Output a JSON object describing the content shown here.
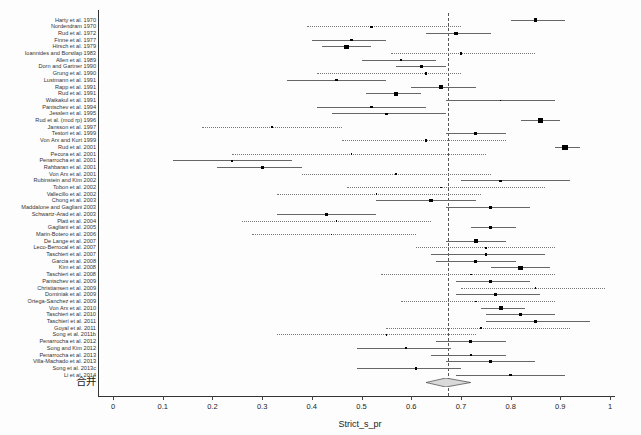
{
  "chart_data": {
    "type": "forest",
    "title": "",
    "xlabel": "Strict_s_pr",
    "xlim": [
      0,
      1
    ],
    "xtick_labels": [
      "0",
      "0.1",
      "0.2",
      "0.3",
      "0.4",
      "0.5",
      "0.6",
      "0.7",
      "0.8",
      "0.9",
      "1"
    ],
    "xtick_values": [
      0,
      0.1,
      0.2,
      0.3,
      0.4,
      0.5,
      0.6,
      0.7,
      0.8,
      0.9,
      1
    ],
    "reference_line": 0.675,
    "grid": false,
    "colors": {
      "axis": "#333333",
      "ci_line": "#666666",
      "marker": "#000000",
      "reference": "#555555",
      "diamond_fill": "#d9d9d9"
    },
    "studies": [
      {
        "label": "Harty et al. 1970",
        "est": 0.85,
        "lo": 0.8,
        "hi": 0.91,
        "size": 3
      },
      {
        "label": "Nordendram 1970",
        "est": 0.52,
        "lo": 0.39,
        "hi": 0.7,
        "size": 2
      },
      {
        "label": "Rud et al. 1972",
        "est": 0.69,
        "lo": 0.63,
        "hi": 0.76,
        "size": 3
      },
      {
        "label": "Finne et al. 1977",
        "est": 0.48,
        "lo": 0.4,
        "hi": 0.55,
        "size": 2
      },
      {
        "label": "Hirsch et al. 1979",
        "est": 0.47,
        "lo": 0.42,
        "hi": 0.52,
        "size": 4
      },
      {
        "label": "Ioannides and Borstlap 1983",
        "est": 0.7,
        "lo": 0.56,
        "hi": 0.85,
        "size": 2
      },
      {
        "label": "Allen et al. 1989",
        "est": 0.58,
        "lo": 0.5,
        "hi": 0.65,
        "size": 2
      },
      {
        "label": "Dorn and Gartner 1990",
        "est": 0.62,
        "lo": 0.57,
        "hi": 0.67,
        "size": 3
      },
      {
        "label": "Grung et al. 1990",
        "est": 0.63,
        "lo": 0.41,
        "hi": 0.7,
        "size": 2
      },
      {
        "label": "Lustmann et al. 1991",
        "est": 0.45,
        "lo": 0.35,
        "hi": 0.55,
        "size": 2
      },
      {
        "label": "Rapp et al. 1991",
        "est": 0.66,
        "lo": 0.6,
        "hi": 0.73,
        "size": 3
      },
      {
        "label": "Rud et al. 1991",
        "est": 0.57,
        "lo": 0.51,
        "hi": 0.62,
        "size": 4
      },
      {
        "label": "Waikakul et al. 1991",
        "est": 0.78,
        "lo": 0.67,
        "hi": 0.89,
        "size": 1
      },
      {
        "label": "Pantschev et al. 1994",
        "est": 0.52,
        "lo": 0.41,
        "hi": 0.63,
        "size": 2
      },
      {
        "label": "Jesslen et al. 1995",
        "est": 0.55,
        "lo": 0.44,
        "hi": 0.67,
        "size": 2
      },
      {
        "label": "Rud et al. (mod rp) 1996",
        "est": 0.86,
        "lo": 0.82,
        "hi": 0.9,
        "size": 4
      },
      {
        "label": "Jansson et al. 1997",
        "est": 0.32,
        "lo": 0.18,
        "hi": 0.46,
        "size": 2
      },
      {
        "label": "Testori et al. 1999",
        "est": 0.73,
        "lo": 0.67,
        "hi": 0.79,
        "size": 3
      },
      {
        "label": "Von Arx and Kurt 1999",
        "est": 0.63,
        "lo": 0.46,
        "hi": 0.79,
        "size": 2
      },
      {
        "label": "Rud et al. 2001",
        "est": 0.91,
        "lo": 0.89,
        "hi": 0.94,
        "size": 5
      },
      {
        "label": "Pecora et al. 2001",
        "est": 0.48,
        "lo": 0.24,
        "hi": 0.75,
        "size": 1
      },
      {
        "label": "Penarrocha et al. 2001",
        "est": 0.24,
        "lo": 0.12,
        "hi": 0.36,
        "size": 2
      },
      {
        "label": "Rahbaran et al. 2001",
        "est": 0.3,
        "lo": 0.21,
        "hi": 0.38,
        "size": 3
      },
      {
        "label": "Von Arx et al. 2001",
        "est": 0.57,
        "lo": 0.38,
        "hi": 0.76,
        "size": 2
      },
      {
        "label": "Rubinstein and Kim 2002",
        "est": 0.78,
        "lo": 0.7,
        "hi": 0.92,
        "size": 2
      },
      {
        "label": "Tobon et al. 2002",
        "est": 0.66,
        "lo": 0.47,
        "hi": 0.87,
        "size": 1
      },
      {
        "label": "Vallecillo et al. 2002",
        "est": 0.53,
        "lo": 0.33,
        "hi": 0.74,
        "size": 1
      },
      {
        "label": "Chong et al. 2003",
        "est": 0.64,
        "lo": 0.53,
        "hi": 0.73,
        "size": 3
      },
      {
        "label": "Maddalone and Gagliani 2003",
        "est": 0.76,
        "lo": 0.67,
        "hi": 0.84,
        "size": 3
      },
      {
        "label": "Schwartz-Arad et al. 2003",
        "est": 0.43,
        "lo": 0.33,
        "hi": 0.53,
        "size": 3
      },
      {
        "label": "Platt et al. 2004",
        "est": 0.45,
        "lo": 0.26,
        "hi": 0.64,
        "size": 1
      },
      {
        "label": "Gagliani et al. 2005",
        "est": 0.76,
        "lo": 0.72,
        "hi": 0.81,
        "size": 3
      },
      {
        "label": "Marin-Botero et al. 2006",
        "est": 0.44,
        "lo": 0.28,
        "hi": 0.61,
        "size": 1
      },
      {
        "label": "De Lange et al. 2007",
        "est": 0.73,
        "lo": 0.67,
        "hi": 0.79,
        "size": 4
      },
      {
        "label": "Leco-Berrocal et al. 2007",
        "est": 0.75,
        "lo": 0.61,
        "hi": 0.89,
        "size": 1
      },
      {
        "label": "Taschieri et al. 2007",
        "est": 0.75,
        "lo": 0.64,
        "hi": 0.87,
        "size": 2
      },
      {
        "label": "Garcia et al. 2008",
        "est": 0.73,
        "lo": 0.65,
        "hi": 0.81,
        "size": 3
      },
      {
        "label": "Kim et al. 2008",
        "est": 0.82,
        "lo": 0.76,
        "hi": 0.88,
        "size": 4
      },
      {
        "label": "Taschieri et al. 2008",
        "est": 0.72,
        "lo": 0.54,
        "hi": 0.89,
        "size": 1
      },
      {
        "label": "Pantschev et al. 2009",
        "est": 0.76,
        "lo": 0.69,
        "hi": 0.84,
        "size": 3
      },
      {
        "label": "Christiansen et al. 2009",
        "est": 0.85,
        "lo": 0.7,
        "hi": 0.99,
        "size": 1
      },
      {
        "label": "Dominiak et al. 2009",
        "est": 0.77,
        "lo": 0.69,
        "hi": 0.86,
        "size": 3
      },
      {
        "label": "Ortega-Sanchez et al. 2009",
        "est": 0.73,
        "lo": 0.58,
        "hi": 0.89,
        "size": 1
      },
      {
        "label": "Von Arx et al. 2010",
        "est": 0.78,
        "lo": 0.74,
        "hi": 0.83,
        "size": 4
      },
      {
        "label": "Taschieri et al. 2010",
        "est": 0.82,
        "lo": 0.75,
        "hi": 0.89,
        "size": 3
      },
      {
        "label": "Taschieri et al. 2011",
        "est": 0.85,
        "lo": 0.75,
        "hi": 0.96,
        "size": 3
      },
      {
        "label": "Goyal et al. 2011",
        "est": 0.74,
        "lo": 0.55,
        "hi": 0.92,
        "size": 1
      },
      {
        "label": "Song et al. 2011b",
        "est": 0.55,
        "lo": 0.33,
        "hi": 0.73,
        "size": 1
      },
      {
        "label": "Penarrocha et al. 2012",
        "est": 0.72,
        "lo": 0.65,
        "hi": 0.79,
        "size": 3
      },
      {
        "label": "Song and Kim 2012",
        "est": 0.59,
        "lo": 0.49,
        "hi": 0.68,
        "size": 2
      },
      {
        "label": "Penarrocha et al. 2013",
        "est": 0.72,
        "lo": 0.64,
        "hi": 0.79,
        "size": 2
      },
      {
        "label": "Villa-Machado et al. 2013",
        "est": 0.76,
        "lo": 0.67,
        "hi": 0.85,
        "size": 3
      },
      {
        "label": "Song et al. 2013c",
        "est": 0.61,
        "lo": 0.49,
        "hi": 0.7,
        "size": 2
      },
      {
        "label": "Li et al. 2014",
        "est": 0.8,
        "lo": 0.69,
        "hi": 0.91,
        "size": 2
      }
    ],
    "pooled": {
      "label": "合并",
      "est": 0.67,
      "lo": 0.63,
      "hi": 0.72
    }
  }
}
